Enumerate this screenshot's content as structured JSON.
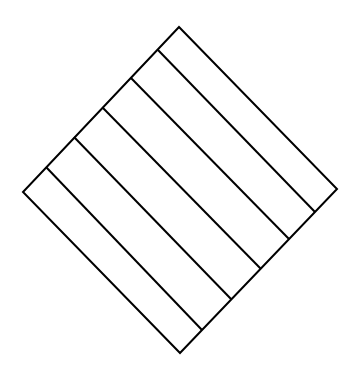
{
  "canvas": {
    "width": 349,
    "height": 383,
    "background": "#ffffff"
  },
  "style": {
    "stroke": "#000000",
    "stroke_width": 2
  },
  "diagram": {
    "shape": "rotated-square-striped",
    "outline": {
      "top": [
        179,
        27
      ],
      "right": [
        337,
        189
      ],
      "bottom": [
        180,
        353
      ],
      "left": [
        23,
        192
      ]
    },
    "stripes": [
      {
        "from": [
          46,
          167
        ],
        "to": [
          202,
          330
        ]
      },
      {
        "from": [
          74,
          137
        ],
        "to": [
          231,
          299
        ]
      },
      {
        "from": [
          103,
          108
        ],
        "to": [
          261,
          269
        ]
      },
      {
        "from": [
          131,
          78
        ],
        "to": [
          289,
          239
        ]
      },
      {
        "from": [
          158,
          50
        ],
        "to": [
          315,
          212
        ]
      }
    ],
    "stripe_count": 5,
    "band_count": 6
  }
}
